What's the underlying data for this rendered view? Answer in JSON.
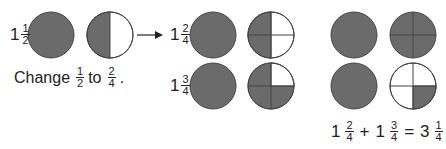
{
  "colors": {
    "shade": "#6b6b6b",
    "outline": "#444444",
    "background": "#ffffff"
  },
  "left": {
    "mixed": {
      "whole": "1",
      "num": "1",
      "den": "2"
    },
    "caption": {
      "prefix": "Change",
      "from_num": "1",
      "from_den": "2",
      "mid": "to",
      "to_num": "2",
      "to_den": "4",
      "suffix": "."
    }
  },
  "middle": {
    "row1": {
      "whole": "1",
      "num": "2",
      "den": "4"
    },
    "row2": {
      "whole": "1",
      "num": "3",
      "den": "4"
    }
  },
  "right": {
    "equation": {
      "a_whole": "1",
      "a_num": "2",
      "a_den": "4",
      "op1": "+",
      "b_whole": "1",
      "b_num": "3",
      "b_den": "4",
      "op2": "=",
      "c_whole": "3",
      "c_num": "1",
      "c_den": "4"
    }
  }
}
